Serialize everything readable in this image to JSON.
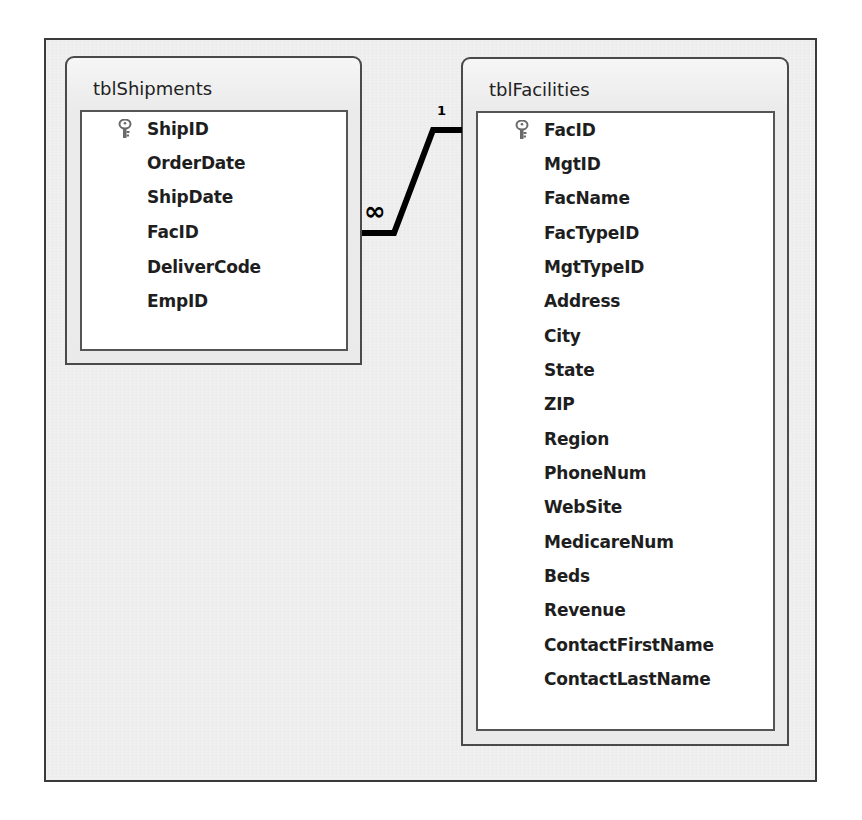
{
  "diagram": {
    "type": "relationships",
    "tables": [
      {
        "name": "tblShipments",
        "fields": [
          {
            "name": "ShipID",
            "primary_key": true
          },
          {
            "name": "OrderDate",
            "primary_key": false
          },
          {
            "name": "ShipDate",
            "primary_key": false
          },
          {
            "name": "FacID",
            "primary_key": false
          },
          {
            "name": "DeliverCode",
            "primary_key": false
          },
          {
            "name": "EmpID",
            "primary_key": false
          }
        ]
      },
      {
        "name": "tblFacilities",
        "fields": [
          {
            "name": "FacID",
            "primary_key": true
          },
          {
            "name": "MgtID",
            "primary_key": false
          },
          {
            "name": "FacName",
            "primary_key": false
          },
          {
            "name": "FacTypeID",
            "primary_key": false
          },
          {
            "name": "MgtTypeID",
            "primary_key": false
          },
          {
            "name": "Address",
            "primary_key": false
          },
          {
            "name": "City",
            "primary_key": false
          },
          {
            "name": "State",
            "primary_key": false
          },
          {
            "name": "ZIP",
            "primary_key": false
          },
          {
            "name": "Region",
            "primary_key": false
          },
          {
            "name": "PhoneNum",
            "primary_key": false
          },
          {
            "name": "WebSite",
            "primary_key": false
          },
          {
            "name": "MedicareNum",
            "primary_key": false
          },
          {
            "name": "Beds",
            "primary_key": false
          },
          {
            "name": "Revenue",
            "primary_key": false
          },
          {
            "name": "ContactFirstName",
            "primary_key": false
          },
          {
            "name": "ContactLastName",
            "primary_key": false
          }
        ]
      }
    ],
    "relationship": {
      "from_table": "tblShipments",
      "from_field": "FacID",
      "to_table": "tblFacilities",
      "to_field": "FacID",
      "many_label": "∞",
      "one_label": "1"
    },
    "icons": {
      "primary_key": "key-icon"
    },
    "colors": {
      "background": "#eeeeee",
      "border": "#3a3a3a",
      "list_background": "#ffffff",
      "line": "#000000"
    }
  }
}
